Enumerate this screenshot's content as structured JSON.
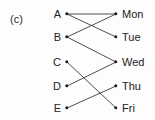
{
  "figure": {
    "part_label": "(c)",
    "width": 155,
    "height": 120,
    "background_color": "#fdfdfd",
    "line_color": "#3a3a3a",
    "dot_color": "#1b1b1b",
    "text_color": "#232323"
  },
  "chart_data": {
    "type": "diagram",
    "diagram_type": "bipartite-mapping",
    "title": "(c)",
    "left_set": {
      "name": "domain",
      "nodes": [
        {
          "id": "A",
          "label": "A",
          "x": 67,
          "y": 14
        },
        {
          "id": "B",
          "label": "B",
          "x": 67,
          "y": 37
        },
        {
          "id": "C",
          "label": "C",
          "x": 67,
          "y": 62
        },
        {
          "id": "D",
          "label": "D",
          "x": 67,
          "y": 86
        },
        {
          "id": "E",
          "label": "E",
          "x": 67,
          "y": 108
        }
      ]
    },
    "right_set": {
      "name": "codomain",
      "nodes": [
        {
          "id": "Mon",
          "label": "Mon",
          "x": 116,
          "y": 14
        },
        {
          "id": "Tue",
          "label": "Tue",
          "x": 116,
          "y": 37
        },
        {
          "id": "Wed",
          "label": "Wed",
          "x": 116,
          "y": 62
        },
        {
          "id": "Thu",
          "label": "Thu",
          "x": 116,
          "y": 86
        },
        {
          "id": "Fri",
          "label": "Fri",
          "x": 116,
          "y": 108
        }
      ]
    },
    "edges": [
      {
        "from": "A",
        "to": "Mon"
      },
      {
        "from": "A",
        "to": "Tue"
      },
      {
        "from": "B",
        "to": "Mon"
      },
      {
        "from": "B",
        "to": "Wed"
      },
      {
        "from": "C",
        "to": "Fri"
      },
      {
        "from": "D",
        "to": "Wed"
      },
      {
        "from": "E",
        "to": "Thu"
      }
    ],
    "edge_count": 7
  }
}
